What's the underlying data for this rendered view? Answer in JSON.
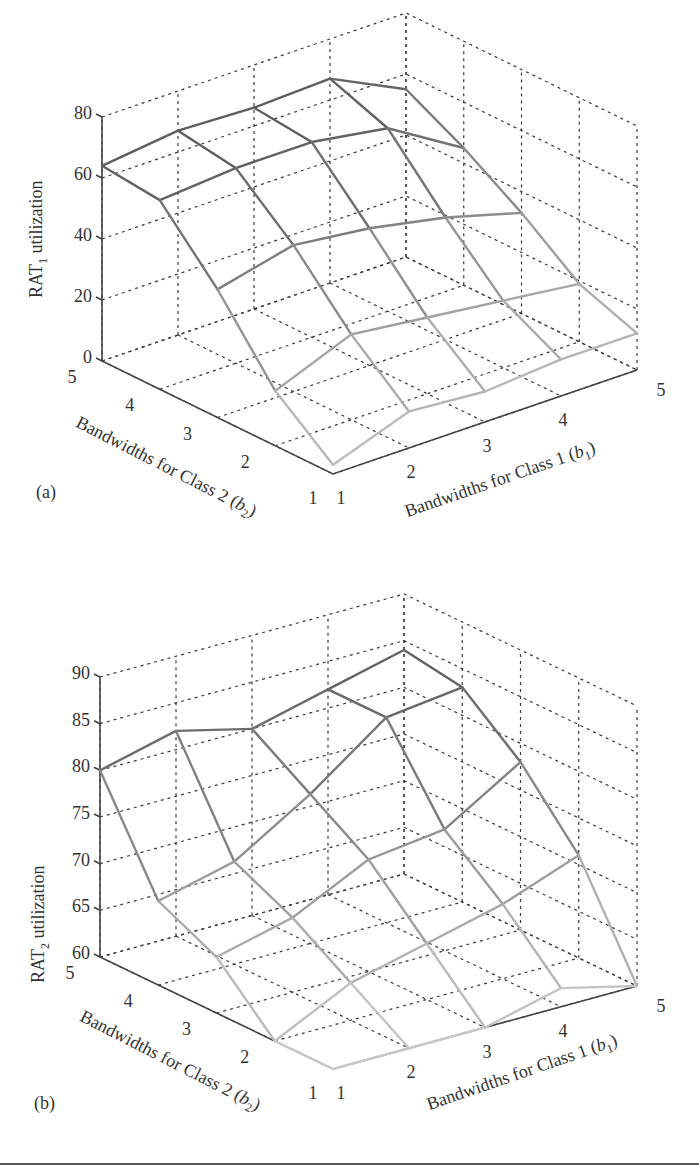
{
  "chart_data": [
    {
      "id": "a",
      "type": "surface",
      "panel_label": "(a)",
      "title": "",
      "zlabel": "RAT",
      "zlabel_sub": "1",
      "zlabel_suffix": " utilization",
      "xlabel": "Bandwidths for Class 1 (",
      "xlabel_var": "b",
      "xlabel_sub": "1",
      "xlabel_end": ")",
      "ylabel": "Bandwidths for Class 2 (",
      "ylabel_var": "b",
      "ylabel_sub": "2",
      "ylabel_end": ")",
      "b1_ticks": [
        1,
        2,
        3,
        4,
        5
      ],
      "b2_ticks": [
        1,
        2,
        3,
        4,
        5
      ],
      "z_ticks": [
        0,
        20,
        40,
        60,
        80
      ],
      "zlim": [
        0,
        80
      ],
      "grid": true,
      "b1": [
        1,
        2,
        3,
        4,
        5
      ],
      "b2": [
        1,
        2,
        3,
        4,
        5
      ],
      "z_rows_by_b2": [
        {
          "b2": 5,
          "values": [
            64,
            67,
            66,
            67,
            55
          ]
        },
        {
          "b2": 4,
          "values": [
            62,
            64,
            64,
            60,
            45
          ]
        },
        {
          "b2": 3,
          "values": [
            42,
            48,
            45,
            40,
            33
          ]
        },
        {
          "b2": 2,
          "values": [
            18,
            28,
            25,
            22,
            19
          ]
        },
        {
          "b2": 1,
          "values": [
            3,
            12,
            10,
            12,
            12
          ]
        }
      ]
    },
    {
      "id": "b",
      "type": "surface",
      "panel_label": "(b)",
      "title": "",
      "zlabel": "RAT",
      "zlabel_sub": "2",
      "zlabel_suffix": " utilization",
      "xlabel": "Bandwidths for Class 1 (",
      "xlabel_var": "b",
      "xlabel_sub": "1",
      "xlabel_end": ")",
      "ylabel": "Bandwidths for Class 2 (",
      "ylabel_var": "b",
      "ylabel_sub": "2",
      "ylabel_end": ")",
      "b1_ticks": [
        1,
        2,
        3,
        4,
        5
      ],
      "b2_ticks": [
        1,
        2,
        3,
        4,
        5
      ],
      "z_ticks": [
        60,
        65,
        70,
        75,
        80,
        85,
        90
      ],
      "zlim": [
        60,
        90
      ],
      "grid": true,
      "b1": [
        1,
        2,
        3,
        4,
        5
      ],
      "b2": [
        1,
        2,
        3,
        4,
        5
      ],
      "z_rows_by_b2": [
        {
          "b2": 5,
          "values": [
            80,
            82,
            80,
            82,
            84
          ]
        },
        {
          "b2": 4,
          "values": [
            69,
            71,
            76,
            82,
            83
          ]
        },
        {
          "b2": 3,
          "values": [
            66,
            68,
            72,
            73,
            78
          ]
        },
        {
          "b2": 2,
          "values": [
            60,
            64,
            66,
            68,
            71
          ]
        },
        {
          "b2": 1,
          "values": [
            55,
            58,
            60,
            62,
            60
          ]
        }
      ]
    }
  ]
}
